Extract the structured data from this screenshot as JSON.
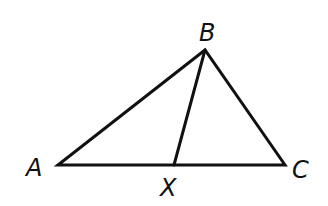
{
  "diagram": {
    "type": "triangle",
    "points": {
      "A": {
        "label": "A",
        "x": 58,
        "y": 165
      },
      "B": {
        "label": "B",
        "x": 205,
        "y": 50
      },
      "C": {
        "label": "C",
        "x": 285,
        "y": 165
      },
      "X": {
        "label": "X",
        "x": 174,
        "y": 165
      }
    },
    "segments": [
      "AB",
      "BC",
      "CA",
      "BX"
    ],
    "labels": {
      "A": "A",
      "B": "B",
      "C": "C",
      "X": "X"
    }
  }
}
